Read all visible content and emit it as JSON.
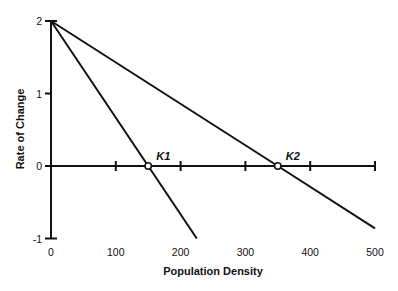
{
  "chart_data": {
    "type": "line",
    "title": "",
    "xlabel": "Population Density",
    "ylabel": "Rate of Change",
    "xlim": [
      0,
      500
    ],
    "ylim": [
      -1,
      2
    ],
    "x_ticks": [
      0,
      100,
      200,
      300,
      400,
      500
    ],
    "x_tick_labels": [
      "0",
      "100",
      "200",
      "300",
      "400",
      "500"
    ],
    "y_ticks": [
      -1,
      0,
      1,
      2
    ],
    "y_tick_labels": [
      "-1",
      "0",
      "1",
      "2"
    ],
    "grid": false,
    "legend": null,
    "series": [
      {
        "name": "K1 line",
        "x": [
          0,
          150,
          225
        ],
        "y": [
          2,
          0,
          -1
        ]
      },
      {
        "name": "K2 line",
        "x": [
          0,
          350,
          500
        ],
        "y": [
          2,
          0,
          -0.86
        ]
      }
    ],
    "annotations": [
      {
        "label": "K1",
        "x": 150,
        "y": 0,
        "marker": "open-circle"
      },
      {
        "label": "K2",
        "x": 350,
        "y": 0,
        "marker": "open-circle"
      }
    ]
  }
}
